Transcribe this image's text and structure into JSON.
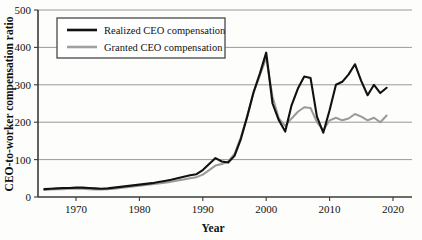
{
  "chart_data": {
    "type": "line",
    "title": "",
    "xlabel": "Year",
    "ylabel": "CEO-to-worker compensation ratio",
    "xlim": [
      1964,
      2023
    ],
    "ylim": [
      0,
      500
    ],
    "grid": true,
    "legend_position": "top-left",
    "xticks": [
      1970,
      1980,
      1990,
      2000,
      2010,
      2020
    ],
    "yticks": [
      0,
      100,
      200,
      300,
      400,
      500
    ],
    "x": [
      1965,
      1966,
      1967,
      1968,
      1969,
      1970,
      1971,
      1972,
      1973,
      1974,
      1975,
      1976,
      1977,
      1978,
      1979,
      1980,
      1981,
      1982,
      1983,
      1984,
      1985,
      1986,
      1987,
      1988,
      1989,
      1990,
      1991,
      1992,
      1993,
      1994,
      1995,
      1996,
      1997,
      1998,
      1999,
      2000,
      2001,
      2002,
      2003,
      2004,
      2005,
      2006,
      2007,
      2008,
      2009,
      2010,
      2011,
      2012,
      2013,
      2014,
      2015,
      2016,
      2017,
      2018,
      2019
    ],
    "series": [
      {
        "name": "Realized CEO compensation",
        "color": "#111111",
        "values": [
          21,
          22,
          23,
          24,
          24,
          25,
          25,
          24,
          23,
          22,
          23,
          25,
          27,
          29,
          31,
          33,
          35,
          37,
          40,
          43,
          46,
          50,
          54,
          58,
          61,
          72,
          88,
          104,
          95,
          92,
          110,
          155,
          215,
          280,
          330,
          386,
          250,
          205,
          175,
          245,
          290,
          322,
          318,
          215,
          172,
          232,
          300,
          308,
          328,
          355,
          310,
          272,
          300,
          278,
          292
        ]
      },
      {
        "name": "Granted CEO compensation",
        "color": "#9a9a9a",
        "values": [
          19,
          20,
          21,
          21,
          22,
          22,
          22,
          21,
          20,
          20,
          21,
          22,
          24,
          26,
          28,
          30,
          32,
          34,
          36,
          38,
          41,
          44,
          47,
          50,
          53,
          60,
          72,
          84,
          88,
          95,
          115,
          160,
          215,
          278,
          325,
          372,
          268,
          210,
          190,
          210,
          228,
          240,
          238,
          200,
          178,
          205,
          212,
          205,
          210,
          222,
          215,
          205,
          212,
          200,
          218
        ]
      }
    ],
    "legend": [
      {
        "label": "Realized CEO compensation",
        "color": "#111111"
      },
      {
        "label": "Granted CEO compensation",
        "color": "#9a9a9a"
      }
    ]
  },
  "axes": {
    "y_tick_labels": [
      "500",
      "400",
      "300",
      "200",
      "100",
      "0"
    ],
    "x_tick_labels": [
      "1970",
      "1980",
      "1990",
      "2000",
      "2010",
      "2020"
    ],
    "x_axis_title": "Year",
    "y_axis_title": "CEO-to-worker compensation ratio"
  },
  "legend": {
    "item_1_label": "Realized CEO compensation",
    "item_2_label": "Granted CEO compensation"
  }
}
